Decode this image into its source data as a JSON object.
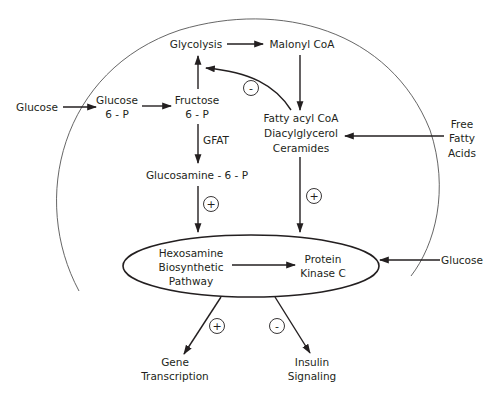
{
  "diagram": {
    "nodes": {
      "glucose_outside_left": "Glucose",
      "glucose_6p_line1": "Glucose",
      "glucose_6p_line2": "6 - P",
      "fructose_6p_line1": "Fructose",
      "fructose_6p_line2": "6 - P",
      "glycolysis": "Glycolysis",
      "malonyl_coa": "Malonyl CoA",
      "gfat": "GFAT",
      "glucosamine_6p": "Glucosamine - 6 - P",
      "lipids_line1": "Fatty acyl CoA",
      "lipids_line2": "Diacylglycerol",
      "lipids_line3": "Ceramides",
      "free_fatty_acids_line1": "Free",
      "free_fatty_acids_line2": "Fatty",
      "free_fatty_acids_line3": "Acids",
      "hexosamine_line1": "Hexosamine",
      "hexosamine_line2": "Biosynthetic",
      "hexosamine_line3": "Pathway",
      "pkc_line1": "Protein",
      "pkc_line2": "Kinase C",
      "glucose_outside_right": "Glucose",
      "gene_line1": "Gene",
      "gene_line2": "Transcription",
      "insulin_line1": "Insulin",
      "insulin_line2": "Signaling"
    },
    "signs": {
      "malonyl_inhibits_glycolysis": "-",
      "glucosamine_to_hexosamine": "+",
      "lipids_to_pkc": "+",
      "hexosamine_to_gene": "+",
      "pkc_to_insulin": "-"
    },
    "edges": [
      {
        "from": "Glucose",
        "to": "Glucose 6-P"
      },
      {
        "from": "Glucose 6-P",
        "to": "Fructose 6-P"
      },
      {
        "from": "Fructose 6-P",
        "to": "Glycolysis"
      },
      {
        "from": "Glycolysis",
        "to": "Malonyl CoA"
      },
      {
        "from": "Malonyl CoA",
        "to": "Fatty acyl CoA / Diacylglycerol / Ceramides"
      },
      {
        "from": "Fatty acyl CoA",
        "to": "Glycolysis",
        "sign": "-"
      },
      {
        "from": "Fructose 6-P",
        "to": "Glucosamine-6-P",
        "label": "GFAT"
      },
      {
        "from": "Free Fatty Acids",
        "to": "Fatty acyl CoA / Diacylglycerol / Ceramides"
      },
      {
        "from": "Glucosamine-6-P",
        "to": "Hexosamine Biosynthetic Pathway",
        "sign": "+"
      },
      {
        "from": "Fatty acyl CoA / Diacylglycerol / Ceramides",
        "to": "Protein Kinase C",
        "sign": "+"
      },
      {
        "from": "Hexosamine Biosynthetic Pathway",
        "to": "Protein Kinase C"
      },
      {
        "from": "Glucose",
        "to": "Protein Kinase C"
      },
      {
        "from": "Hexosamine Biosynthetic Pathway",
        "to": "Gene Transcription",
        "sign": "+"
      },
      {
        "from": "Protein Kinase C",
        "to": "Insulin Signaling",
        "sign": "-"
      }
    ],
    "colors": {
      "line": "#231f20",
      "cell_membrane": "#555555",
      "background": "#ffffff"
    }
  }
}
